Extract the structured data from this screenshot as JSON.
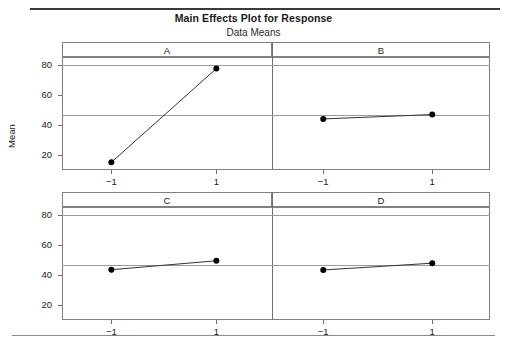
{
  "chart_data": {
    "type": "line",
    "title": "Main Effects Plot for Response",
    "subtitle": "Data Means",
    "ylabel": "Mean",
    "xlabel": "",
    "grid": true,
    "legend": false,
    "reference_line": 46.2,
    "ylim": [
      10,
      85
    ],
    "yticks": [
      20,
      40,
      60,
      80
    ],
    "ytick_labels": [
      "20",
      "40",
      "60",
      "80"
    ],
    "x": [
      -1,
      1
    ],
    "xtick_labels": [
      "−1",
      "1"
    ],
    "panels": [
      {
        "name": "A",
        "values": [
          15.1,
          77.3
        ]
      },
      {
        "name": "B",
        "values": [
          43.9,
          46.8
        ]
      },
      {
        "name": "C",
        "values": [
          43.4,
          49.3
        ]
      },
      {
        "name": "D",
        "values": [
          43.2,
          47.7
        ]
      }
    ]
  },
  "figure": {
    "title": "Main Effects Plot for Response",
    "subtitle": "Data Means",
    "y_axis_label": "Mean",
    "panel_labels": [
      "A",
      "B",
      "C",
      "D"
    ],
    "y_tick_labels": [
      "20",
      "40",
      "60",
      "80"
    ],
    "x_tick_labels": [
      "−1",
      "1"
    ],
    "colors": {
      "line": "#333333",
      "marker": "#000000",
      "grid": "#9a9a9a",
      "frame": "#808080",
      "text": "#1a1a1a"
    }
  }
}
